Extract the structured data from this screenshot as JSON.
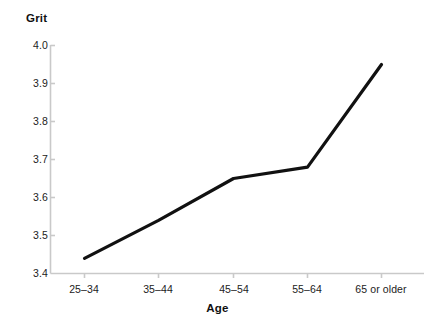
{
  "chart_data": {
    "type": "line",
    "title": "",
    "xlabel": "Age",
    "ylabel": "Grit",
    "categories": [
      "25–34",
      "35–44",
      "45–54",
      "55–64",
      "65 or older"
    ],
    "values": [
      3.44,
      3.54,
      3.65,
      3.68,
      3.95
    ],
    "ylim": [
      3.4,
      4.0
    ],
    "yticks": [
      "3.4",
      "3.5",
      "3.6",
      "3.7",
      "3.8",
      "3.9",
      "4.0"
    ],
    "ytick_values": [
      3.4,
      3.5,
      3.6,
      3.7,
      3.8,
      3.9,
      4.0
    ],
    "grid": false,
    "legend": false,
    "line_color": "#111111",
    "axis_color": "#c9c9c9"
  },
  "axis": {
    "y_title": "Grit",
    "x_title": "Age"
  },
  "y_ticks": [
    {
      "label": "4.0"
    },
    {
      "label": "3.9"
    },
    {
      "label": "3.8"
    },
    {
      "label": "3.7"
    },
    {
      "label": "3.6"
    },
    {
      "label": "3.5"
    },
    {
      "label": "3.4"
    }
  ],
  "x_ticks": [
    {
      "label": "25–34"
    },
    {
      "label": "35–44"
    },
    {
      "label": "45–54"
    },
    {
      "label": "55–64"
    },
    {
      "label": "65 or older"
    }
  ]
}
